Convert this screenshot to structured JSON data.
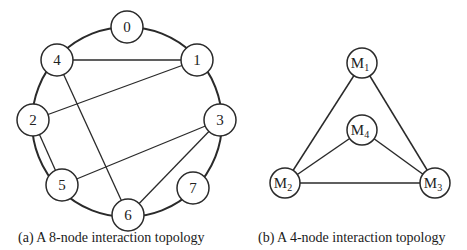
{
  "figure_a": {
    "caption": "(a) A 8-node interaction topology",
    "ring": {
      "cx": 127,
      "cy": 122,
      "r": 95
    },
    "nodes": [
      {
        "id": "0",
        "label": "0",
        "x": 127,
        "y": 27
      },
      {
        "id": "1",
        "label": "1",
        "x": 197,
        "y": 60
      },
      {
        "id": "2",
        "label": "2",
        "x": 33,
        "y": 120
      },
      {
        "id": "3",
        "label": "3",
        "x": 220,
        "y": 120
      },
      {
        "id": "4",
        "label": "4",
        "x": 57,
        "y": 60
      },
      {
        "id": "5",
        "label": "5",
        "x": 62,
        "y": 185
      },
      {
        "id": "6",
        "label": "6",
        "x": 128,
        "y": 215
      },
      {
        "id": "7",
        "label": "7",
        "x": 193,
        "y": 188
      }
    ],
    "chords": [
      [
        "4",
        "1"
      ],
      [
        "1",
        "2"
      ],
      [
        "4",
        "6"
      ],
      [
        "2",
        "5"
      ],
      [
        "5",
        "3"
      ],
      [
        "3",
        "6"
      ]
    ],
    "node_radius": 16
  },
  "figure_b": {
    "caption": "(b) A 4-node interaction topology",
    "nodes": [
      {
        "id": "M1",
        "label": "M",
        "sub": "1",
        "x": 362,
        "y": 63
      },
      {
        "id": "M2",
        "label": "M",
        "sub": "2",
        "x": 285,
        "y": 183
      },
      {
        "id": "M3",
        "label": "M",
        "sub": "3",
        "x": 435,
        "y": 183
      },
      {
        "id": "M4",
        "label": "M",
        "sub": "4",
        "x": 362,
        "y": 130
      }
    ],
    "edges": [
      [
        "M1",
        "M2"
      ],
      [
        "M1",
        "M3"
      ],
      [
        "M2",
        "M3"
      ],
      [
        "M4",
        "M2"
      ],
      [
        "M4",
        "M3"
      ]
    ],
    "node_radius": 15
  },
  "colors": {
    "stroke": "#2a2a2a",
    "fill": "#ffffff",
    "text": "#1a1a1a"
  }
}
